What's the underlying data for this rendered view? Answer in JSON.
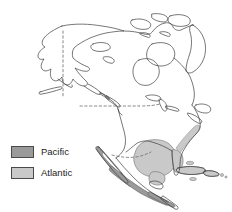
{
  "figure": {
    "background_color": "#ffffff"
  },
  "map": {
    "name": "north-america-outline",
    "outline_color": "#3c3c3c",
    "outline_width": 0.7,
    "land_fill": "#ffffff",
    "border_style": "dashed",
    "border_color": "#6b6b6b",
    "labels": []
  },
  "regions": [
    {
      "key": "pacific",
      "label": "Pacific",
      "color": "#9a9a9a",
      "stroke": "#4a4a4a",
      "description": "Dark grey coastal band along the Pacific coast of Baja California, western Mexico and Central America"
    },
    {
      "key": "atlantic",
      "label": "Atlantic",
      "color": "#c9c9c9",
      "stroke": "#4a4a4a",
      "description": "Light grey area covering the Gulf of Mexico, Florida, the Caribbean islands and the US Atlantic coastal strip"
    }
  ],
  "legend": {
    "name": "map-legend",
    "items": [
      {
        "label": "Pacific",
        "color": "#9a9a9a",
        "swatch_border": "#4a4a4a"
      },
      {
        "label": "Atlantic",
        "color": "#c9c9c9",
        "swatch_border": "#4a4a4a"
      }
    ]
  }
}
